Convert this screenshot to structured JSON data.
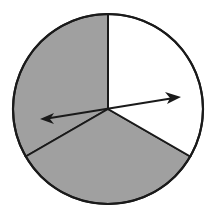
{
  "diagram": {
    "type": "spinner",
    "center": [
      108,
      109
    ],
    "radius": 95,
    "colors": {
      "shaded": "#a0a0a0",
      "unshaded": "#ffffff",
      "outline": "#1a1a1a"
    },
    "sectors": [
      {
        "name": "right-white",
        "fill": "unshaded",
        "start_deg": -90,
        "end_deg": 30,
        "fraction": "1/3"
      },
      {
        "name": "bottom-gray",
        "fill": "shaded",
        "start_deg": 30,
        "end_deg": 150,
        "fraction": "1/3"
      },
      {
        "name": "left-gray",
        "fill": "shaded",
        "start_deg": 150,
        "end_deg": 270,
        "fraction": "1/3"
      }
    ],
    "arrow": {
      "tail": [
        41,
        119
      ],
      "head": [
        180,
        97
      ]
    }
  }
}
